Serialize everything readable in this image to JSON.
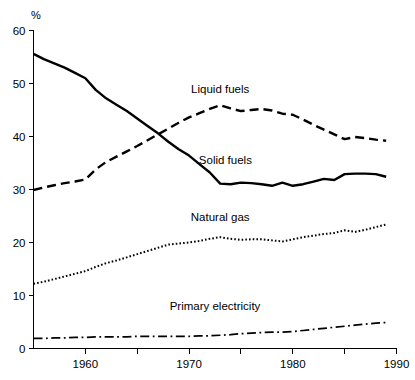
{
  "chart_data": {
    "type": "line",
    "title": "",
    "xlabel": "",
    "ylabel": "%",
    "ylim": [
      0,
      60
    ],
    "xlim": [
      1955,
      1990
    ],
    "grid": false,
    "legend_position": "inline-annotations",
    "y_ticks": [
      0,
      10,
      20,
      30,
      40,
      50,
      60
    ],
    "y_tick_labels": [
      "0",
      "10",
      "20",
      "30",
      "40",
      "50",
      "60"
    ],
    "x_ticks": [
      1960,
      1965,
      1970,
      1975,
      1980,
      1985,
      1990
    ],
    "x_tick_labels": [
      "1960",
      "",
      "1970",
      "",
      "1980",
      "",
      "1990"
    ],
    "x": [
      1955,
      1956,
      1957,
      1958,
      1959,
      1960,
      1961,
      1962,
      1963,
      1964,
      1965,
      1966,
      1967,
      1968,
      1969,
      1970,
      1971,
      1972,
      1973,
      1974,
      1975,
      1976,
      1977,
      1978,
      1979,
      1980,
      1981,
      1982,
      1983,
      1984,
      1985,
      1986,
      1987,
      1988,
      1989
    ],
    "series": [
      {
        "name": "Solid fuels",
        "line_style": "solid",
        "color": "#000000",
        "label_x": 1973.5,
        "label_y": 34.8,
        "values": [
          55.6,
          54.6,
          53.8,
          53.0,
          52.0,
          51.0,
          48.8,
          47.2,
          46.0,
          44.8,
          43.4,
          42.0,
          40.6,
          39.0,
          37.6,
          36.4,
          34.8,
          33.2,
          31.1,
          31.0,
          31.3,
          31.2,
          31.0,
          30.7,
          31.3,
          30.7,
          31.0,
          31.5,
          32.0,
          31.8,
          32.9,
          33.0,
          33.0,
          32.9,
          32.4
        ]
      },
      {
        "name": "Liquid fuels",
        "line_style": "dashed",
        "color": "#000000",
        "label_x": 1973.0,
        "label_y": 48.2,
        "values": [
          29.9,
          30.4,
          30.8,
          31.2,
          31.5,
          31.9,
          33.8,
          35.2,
          36.2,
          37.2,
          38.2,
          39.3,
          40.4,
          41.5,
          42.6,
          43.6,
          44.4,
          45.2,
          45.9,
          45.3,
          44.8,
          45.0,
          45.2,
          44.9,
          44.3,
          44.1,
          43.2,
          42.2,
          41.3,
          40.4,
          39.5,
          39.9,
          39.7,
          39.4,
          39.2
        ]
      },
      {
        "name": "Natural gas",
        "line_style": "dotted",
        "color": "#000000",
        "label_x": 1973.0,
        "label_y": 24.1,
        "values": [
          12.2,
          12.6,
          13.1,
          13.6,
          14.1,
          14.6,
          15.4,
          16.1,
          16.6,
          17.2,
          17.8,
          18.4,
          19.0,
          19.6,
          19.8,
          20.0,
          20.3,
          20.7,
          21.0,
          20.7,
          20.5,
          20.6,
          20.6,
          20.4,
          20.2,
          20.6,
          21.0,
          21.3,
          21.6,
          21.8,
          22.3,
          22.0,
          22.4,
          22.9,
          23.4
        ]
      },
      {
        "name": "Primary electricity",
        "line_style": "dashdot",
        "color": "#000000",
        "label_x": 1972.5,
        "label_y": 7.3,
        "values": [
          1.9,
          1.9,
          2.0,
          2.0,
          2.1,
          2.1,
          2.2,
          2.2,
          2.2,
          2.2,
          2.3,
          2.3,
          2.3,
          2.3,
          2.3,
          2.3,
          2.4,
          2.4,
          2.5,
          2.6,
          2.8,
          2.9,
          3.0,
          3.1,
          3.1,
          3.2,
          3.4,
          3.6,
          3.8,
          4.0,
          4.2,
          4.4,
          4.6,
          4.8,
          4.9
        ]
      }
    ]
  }
}
